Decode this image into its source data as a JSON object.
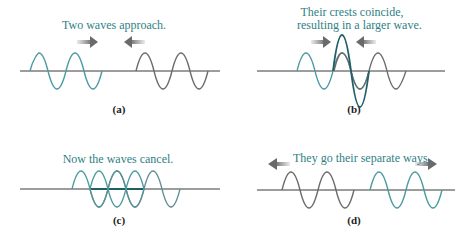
{
  "figure": {
    "colors": {
      "teal_wave": "#4a9aa0",
      "gray_wave": "#6b6b6b",
      "resultant_wave": "#1f5f66",
      "axis": "#3a3a3a",
      "caption_text": "#2f7f86",
      "arrow": "#7a7a7a"
    },
    "panels": [
      {
        "id": "a",
        "caption": "Two waves approach.",
        "label": "(a)",
        "arrows": [
          "right",
          "left"
        ]
      },
      {
        "id": "b",
        "caption_line1": "Their crests coincide,",
        "caption_line2": "resulting in a larger wave.",
        "label": "(b)",
        "arrows": [
          "right",
          "left"
        ]
      },
      {
        "id": "c",
        "caption": "Now the waves cancel.",
        "label": "(c)",
        "arrows": []
      },
      {
        "id": "d",
        "caption": "They go their separate ways.",
        "label": "(d)",
        "arrows": [
          "left",
          "right"
        ]
      }
    ]
  }
}
